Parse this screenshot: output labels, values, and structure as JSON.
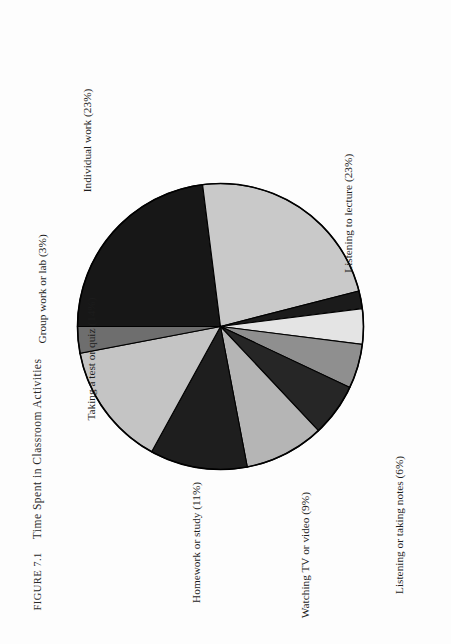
{
  "figure": {
    "number_label": "Figure 7.1",
    "title": "Time Spent in Classroom Activities"
  },
  "chart_data": {
    "type": "pie",
    "title": "Time Spent in Classroom Activities",
    "unit": "percent",
    "total": 100,
    "start_angle_deg": 0,
    "direction": "clockwise",
    "legend": "none (direct labels with leader placement)",
    "categories": [
      "Individual work",
      "Listening to lecture",
      "Other",
      "Talking to teacher or friends",
      "Discussion",
      "Listening or taking notes",
      "Watching TV or video",
      "Homework or study",
      "Taking a test or quiz",
      "Group work or lab"
    ],
    "values": [
      23,
      23,
      2,
      4,
      5,
      6,
      9,
      11,
      14,
      3
    ],
    "labels": [
      "Individual work (23%)",
      "Listening to lecture (23%)",
      "Other (2%)",
      "Talking to teacher or friends (4%)",
      "Discussion (5%)",
      "Listening or taking notes (6%)",
      "Watching TV or video (9%)",
      "Homework or study (11%)",
      "Taking a test or quiz (14%)",
      "Group work or lab (3%)"
    ],
    "colors": [
      "#171717",
      "#c9c9c9",
      "#1b1b1b",
      "#e4e4e4",
      "#8f8f8f",
      "#262626",
      "#b5b5b5",
      "#1e1e1e",
      "#c4c4c4",
      "#6e6e6e"
    ]
  },
  "slices": [
    {
      "name": "Individual work",
      "label": "Individual work (23%)",
      "value": 23,
      "color": "#171717"
    },
    {
      "name": "Listening to lecture",
      "label": "Listening to lecture (23%)",
      "value": 23,
      "color": "#c9c9c9"
    },
    {
      "name": "Other",
      "label": "Other (2%)",
      "value": 2,
      "color": "#1b1b1b"
    },
    {
      "name": "Talking to teacher or friends",
      "label": "Talking to teacher or friends (4%)",
      "value": 4,
      "color": "#e4e4e4"
    },
    {
      "name": "Discussion",
      "label": "Discussion (5%)",
      "value": 5,
      "color": "#8f8f8f"
    },
    {
      "name": "Listening or taking notes",
      "label": "Listening or taking notes (6%)",
      "value": 6,
      "color": "#262626"
    },
    {
      "name": "Watching TV or video",
      "label": "Watching TV or video (9%)",
      "value": 9,
      "color": "#b5b5b5"
    },
    {
      "name": "Homework or study",
      "label": "Homework or study (11%)",
      "value": 11,
      "color": "#1e1e1e"
    },
    {
      "name": "Taking a test or quiz",
      "label": "Taking a test or quiz (14%)",
      "value": 14,
      "color": "#c4c4c4"
    },
    {
      "name": "Group work or lab",
      "label": "Group work or lab (3%)",
      "value": 3,
      "color": "#6e6e6e"
    }
  ],
  "style": {
    "outline_color": "#000000",
    "background": "#fdfdfd"
  }
}
